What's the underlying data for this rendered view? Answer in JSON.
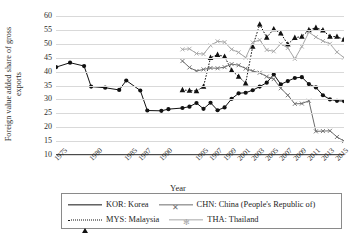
{
  "chart_data": {
    "type": "line",
    "title": "",
    "xlabel": "Year",
    "ylabel_line1": "Foreign value added share of gross",
    "ylabel_line2": "exports",
    "ylim": [
      10,
      60
    ],
    "yticks": [
      60,
      55,
      50,
      45,
      40,
      35,
      30,
      25,
      20,
      15,
      10
    ],
    "grid": true,
    "legend_position": "bottom",
    "xlim": [
      1975,
      2016
    ],
    "xticks": [
      "1975",
      "1980",
      "1985",
      "1987",
      "1990",
      "1995",
      "1997",
      "1999",
      "2001",
      "2003",
      "2005",
      "2007",
      "2009",
      "2011",
      "2013",
      "2015"
    ],
    "xtick_values": [
      1975,
      1980,
      1985,
      1987,
      1990,
      1995,
      1997,
      1999,
      2001,
      2003,
      2005,
      2007,
      2009,
      2011,
      2013,
      2015
    ],
    "series": [
      {
        "name": "KOR: Korea",
        "code": "KOR",
        "color": "#111111",
        "style": "solid",
        "marker": "filled-circle",
        "x": [
          1975,
          1977,
          1979,
          1980,
          1982,
          1984,
          1985,
          1987,
          1988,
          1990,
          1991,
          1993,
          1994,
          1995,
          1996,
          1997,
          1998,
          1999,
          2000,
          2001,
          2002,
          2003,
          2004,
          2005,
          2006,
          2007,
          2008,
          2009,
          2010,
          2011,
          2012,
          2013,
          2014,
          2015,
          2016
        ],
        "values": [
          41.6,
          43.2,
          42.0,
          34.6,
          34.2,
          33.4,
          36.8,
          33.2,
          26.0,
          25.9,
          26.5,
          26.9,
          27.4,
          28.7,
          26.6,
          28.8,
          26.1,
          27.1,
          30.2,
          32.2,
          32.4,
          33.3,
          34.6,
          36.0,
          39.0,
          35.4,
          36.6,
          37.7,
          38.0,
          35.5,
          34.3,
          31.5,
          30.0,
          29.5,
          29.4
        ]
      },
      {
        "name": "CHN: China (People's Republic of)",
        "code": "CHN",
        "color": "#6d6d6d",
        "style": "solid",
        "marker": "x",
        "x": [
          1993,
          1994,
          1995,
          1996,
          1997,
          1998,
          1999,
          2000,
          2001,
          2002,
          2003,
          2004,
          2005,
          2006,
          2007,
          2008,
          2009,
          2010,
          2011,
          2012,
          2013,
          2014,
          2015,
          2016
        ],
        "values": [
          43.8,
          41.5,
          40.2,
          40.8,
          41.3,
          41.2,
          41.6,
          42.7,
          42.3,
          41.1,
          40.2,
          39.6,
          38.2,
          37.3,
          34.0,
          31.5,
          28.4,
          28.5,
          29.5,
          18.5,
          18.6,
          18.7,
          16.5,
          15.0
        ]
      },
      {
        "name": "MYS: Malaysia",
        "code": "MYS",
        "color": "#111111",
        "style": "dotted",
        "marker": "filled-triangle",
        "x": [
          1993,
          1994,
          1995,
          1996,
          1997,
          1998,
          1999,
          2000,
          2001,
          2002,
          2003,
          2004,
          2005,
          2006,
          2007,
          2008,
          2009,
          2010,
          2011,
          2012,
          2013,
          2014,
          2015,
          2016
        ],
        "values": [
          33.4,
          33.2,
          33.0,
          34.6,
          45.0,
          46.1,
          45.4,
          40.5,
          38.2,
          35.8,
          49.0,
          57.0,
          52.3,
          55.3,
          53.8,
          49.8,
          52.2,
          52.6,
          55.0,
          55.8,
          54.9,
          52.6,
          52.6,
          51.5
        ]
      },
      {
        "name": "THA: Thailand",
        "code": "THA",
        "color": "#a6a6a6",
        "style": "solid",
        "marker": "x",
        "x": [
          1993,
          1994,
          1995,
          1996,
          1997,
          1998,
          1999,
          2000,
          2001,
          2002,
          2003,
          2004,
          2005,
          2006,
          2007,
          2008,
          2009,
          2010,
          2011,
          2012,
          2013,
          2014,
          2015,
          2016
        ],
        "values": [
          48.0,
          48.2,
          46.5,
          46.3,
          49.4,
          50.9,
          50.6,
          48.0,
          46.9,
          45.0,
          50.5,
          51.4,
          47.8,
          47.3,
          50.0,
          48.5,
          44.6,
          49.0,
          54.2,
          52.4,
          51.0,
          50.0,
          47.0,
          45.0
        ]
      }
    ]
  },
  "legend": {
    "entries": [
      {
        "label": "KOR: Korea"
      },
      {
        "label": "CHN: China (People's Republic of)"
      },
      {
        "label": "MYS: Malaysia"
      },
      {
        "label": "THA: Thailand"
      }
    ]
  }
}
